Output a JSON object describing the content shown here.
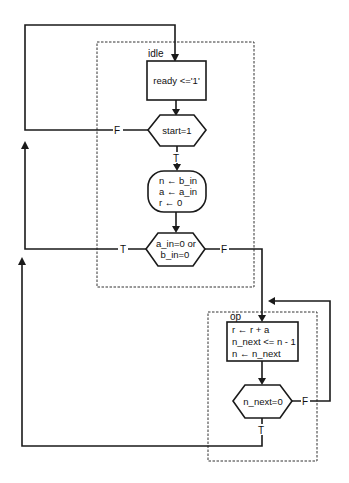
{
  "regions": {
    "idle": {
      "label": "idle"
    },
    "op": {
      "label": "op"
    }
  },
  "nodes": {
    "ready": {
      "type": "process",
      "text": "ready <='1'"
    },
    "start_check": {
      "type": "decision",
      "text": "start=1"
    },
    "init": {
      "type": "process",
      "lines": [
        "n ← b_in",
        "a ← a_in",
        "r ← 0"
      ]
    },
    "zero_check": {
      "type": "decision",
      "lines": [
        "a_in=0 or",
        "b_in=0"
      ]
    },
    "op_block": {
      "type": "process",
      "lines": [
        "r ← r + a",
        "n_next <=  n - 1",
        "n ← n_next"
      ]
    },
    "n_check": {
      "type": "decision",
      "text": "n_next=0"
    }
  },
  "edges": {
    "start_false": "F",
    "start_true": "T",
    "zero_true": "T",
    "zero_false": "F",
    "n_false": "F",
    "n_true": "T"
  }
}
